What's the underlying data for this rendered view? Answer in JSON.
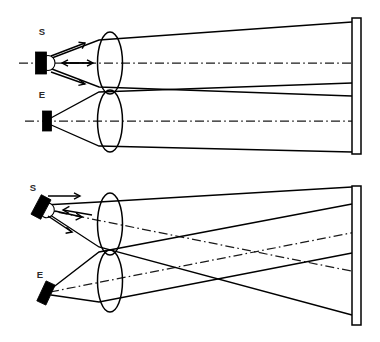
{
  "figure": {
    "title": "Optical ray diagram: source and detector through twin lenses onto screen",
    "canvas": {
      "width": 380,
      "height": 342
    },
    "background_color": "#ffffff",
    "line_color": "#000000",
    "label_color": "#2b2b2b"
  },
  "panels": [
    {
      "id": "top-panel",
      "name": "aligned-configuration",
      "devices": [
        {
          "key": "source",
          "label": "S",
          "label_x": 42,
          "label_y": 35,
          "shape": "rectangle-with-dome",
          "tilt_deg": 0,
          "cx": 41,
          "cy": 63,
          "box_w": 11,
          "box_h": 22,
          "dome_rx": 7,
          "dome_ry": 7.5,
          "fill": "#000000"
        },
        {
          "key": "detector",
          "label": "E",
          "label_x": 42,
          "label_y": 98,
          "shape": "rectangle",
          "tilt_deg": 0,
          "cx": 47,
          "cy": 121,
          "box_w": 9,
          "box_h": 20,
          "fill": "#000000"
        }
      ],
      "lenses": [
        {
          "key": "upper-lens",
          "cx": 110,
          "cy": 63,
          "rx": 12.5,
          "ry": 31
        },
        {
          "key": "lower-lens",
          "cx": 110,
          "cy": 121,
          "rx": 12.5,
          "ry": 31
        }
      ],
      "screen": {
        "key": "screen",
        "x": 352,
        "y": 18,
        "width": 9,
        "height": 136
      },
      "axes": [
        {
          "key": "upper-optic-axis",
          "x1": 19,
          "y1": 63,
          "x2": 356,
          "y2": 63
        },
        {
          "key": "lower-optic-axis",
          "x1": 25,
          "y1": 121,
          "x2": 356,
          "y2": 121
        }
      ],
      "rays": [
        {
          "key": "source-upper-ray",
          "points": "44,61 99,40 352,22"
        },
        {
          "key": "source-lower-ray",
          "points": "44,66 99,87 352,96"
        },
        {
          "key": "detector-upper-ray",
          "points": "49,119 99,92 352,83"
        },
        {
          "key": "detector-lower-ray",
          "points": "49,124 99,146 352,152"
        }
      ],
      "arrows": [
        {
          "key": "arrow-source-up",
          "x1": 51,
          "y1": 56,
          "x2": 85,
          "y2": 43
        },
        {
          "key": "arrow-source-axis",
          "x1": 62,
          "y1": 63,
          "x2": 93,
          "y2": 63
        },
        {
          "key": "arrow-source-down",
          "x1": 51,
          "y1": 72,
          "x2": 85,
          "y2": 84
        },
        {
          "key": "arrow-return-axis",
          "x1": 92,
          "y1": 63,
          "x2": 62,
          "y2": 63,
          "reverse": true
        }
      ]
    },
    {
      "id": "bottom-panel",
      "name": "tilted-configuration",
      "devices": [
        {
          "key": "source",
          "label": "S",
          "label_x": 33,
          "label_y": 191,
          "shape": "rectangle-with-dome",
          "tilt_deg": 28,
          "cx": 35,
          "cy": 207,
          "box_w": 11,
          "box_h": 22,
          "dome_rx": 7,
          "dome_ry": 7.5,
          "fill": "#000000"
        },
        {
          "key": "detector",
          "label": "E",
          "label_x": 40,
          "label_y": 278,
          "shape": "rectangle",
          "tilt_deg": 25,
          "cx": 46,
          "cy": 293,
          "box_w": 10,
          "box_h": 22,
          "fill": "#000000"
        }
      ],
      "lenses": [
        {
          "key": "upper-lens",
          "cx": 110,
          "cy": 224,
          "rx": 12.5,
          "ry": 31
        },
        {
          "key": "lower-lens",
          "cx": 110,
          "cy": 281,
          "rx": 12.5,
          "ry": 31
        }
      ],
      "screen": {
        "key": "screen",
        "x": 352,
        "y": 186,
        "width": 9,
        "height": 139
      },
      "axes": [
        {
          "key": "source-chief-axis",
          "x1": 42,
          "y1": 209,
          "x2": 356,
          "y2": 272
        },
        {
          "key": "detector-chief-axis",
          "x1": 50,
          "y1": 292,
          "x2": 356,
          "y2": 232
        }
      ],
      "rays": [
        {
          "key": "source-upper-ray",
          "points": "44,205 99,202 352,187"
        },
        {
          "key": "source-lower-ray",
          "points": "44,211 99,247 352,315"
        },
        {
          "key": "detector-upper-ray",
          "points": "51,289 99,252 352,204"
        },
        {
          "key": "detector-lower-ray",
          "points": "51,295 99,302 352,253"
        }
      ],
      "arrows": [
        {
          "key": "arrow-source-up",
          "x1": 48,
          "y1": 196,
          "x2": 80,
          "y2": 196
        },
        {
          "key": "arrow-source-mid",
          "x1": 55,
          "y1": 211,
          "x2": 82,
          "y2": 217
        },
        {
          "key": "arrow-source-down",
          "x1": 48,
          "y1": 216,
          "x2": 72,
          "y2": 232
        },
        {
          "key": "arrow-return-chief",
          "x1": 92,
          "y1": 215,
          "x2": 63,
          "y2": 210,
          "reverse": true
        }
      ]
    }
  ],
  "legend": {
    "source_label": "S",
    "detector_label": "E",
    "solid_line_meaning": "ray bundle",
    "dash_dot_line_meaning": "optical axis"
  }
}
